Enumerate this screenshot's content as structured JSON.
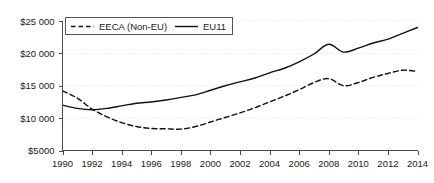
{
  "chart_data": {
    "type": "line",
    "title": "",
    "subtitle": "",
    "xlabel": "",
    "ylabel": "",
    "grid": true,
    "legend_position": "top-left",
    "xlim": [
      1990,
      2014
    ],
    "ylim": [
      5000,
      25000
    ],
    "x": [
      1990,
      1991,
      1992,
      1993,
      1994,
      1995,
      1996,
      1997,
      1998,
      1999,
      2000,
      2001,
      2002,
      2003,
      2004,
      2005,
      2006,
      2007,
      2008,
      2009,
      2010,
      2011,
      2012,
      2013,
      2014
    ],
    "x_tick_labels": [
      "1990",
      "1992",
      "1994",
      "1996",
      "1998",
      "2000",
      "2002",
      "2004",
      "2006",
      "2008",
      "2010",
      "2012",
      "2014"
    ],
    "x_tick_values": [
      1990,
      1992,
      1994,
      1996,
      1998,
      2000,
      2002,
      2004,
      2006,
      2008,
      2010,
      2012,
      2014
    ],
    "y_tick_labels": [
      "$25 000",
      "$20 000",
      "$15 000",
      "$10 000",
      "$5000"
    ],
    "y_tick_values": [
      25000,
      20000,
      15000,
      10000,
      5000
    ],
    "series": [
      {
        "name": "EECA (Non-EU)",
        "style": "dashed",
        "color": "#111111",
        "values": [
          14200,
          13100,
          11400,
          10200,
          9300,
          8700,
          8400,
          8350,
          8300,
          8700,
          9400,
          10100,
          10800,
          11600,
          12500,
          13400,
          14400,
          15500,
          16100,
          15000,
          15500,
          16300,
          16900,
          17400,
          17200
        ]
      },
      {
        "name": "EU11",
        "style": "solid",
        "color": "#111111",
        "values": [
          12000,
          11500,
          11300,
          11500,
          11900,
          12300,
          12500,
          12800,
          13200,
          13600,
          14300,
          15000,
          15600,
          16200,
          17000,
          17700,
          18700,
          19900,
          21400,
          20200,
          20800,
          21600,
          22200,
          23100,
          24000
        ]
      }
    ]
  },
  "legend": {
    "items": [
      {
        "label": "EECA (Non-EU)",
        "style": "dashed"
      },
      {
        "label": "EU11",
        "style": "solid"
      }
    ]
  }
}
